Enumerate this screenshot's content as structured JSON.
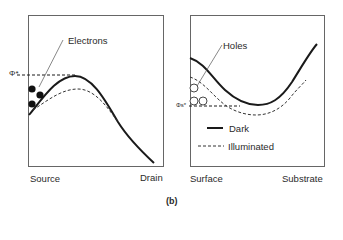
{
  "figure_label": "(b)",
  "left_panel": {
    "name": "source-drain-potential",
    "callout": "Electrons",
    "level_label": "Φ*",
    "x_left_label": "Source",
    "x_right_label": "Drain"
  },
  "right_panel": {
    "name": "surface-substrate-potential",
    "callout": "Holes",
    "level_label": "Φs*",
    "x_left_label": "Surface",
    "x_right_label": "Substrate",
    "legend": [
      {
        "label": "Dark",
        "style": "solid"
      },
      {
        "label": "Illuminated",
        "style": "dashed"
      }
    ]
  },
  "colors": {
    "line": "#1a1a1a",
    "frame": "#555555",
    "background": "#ffffff"
  }
}
